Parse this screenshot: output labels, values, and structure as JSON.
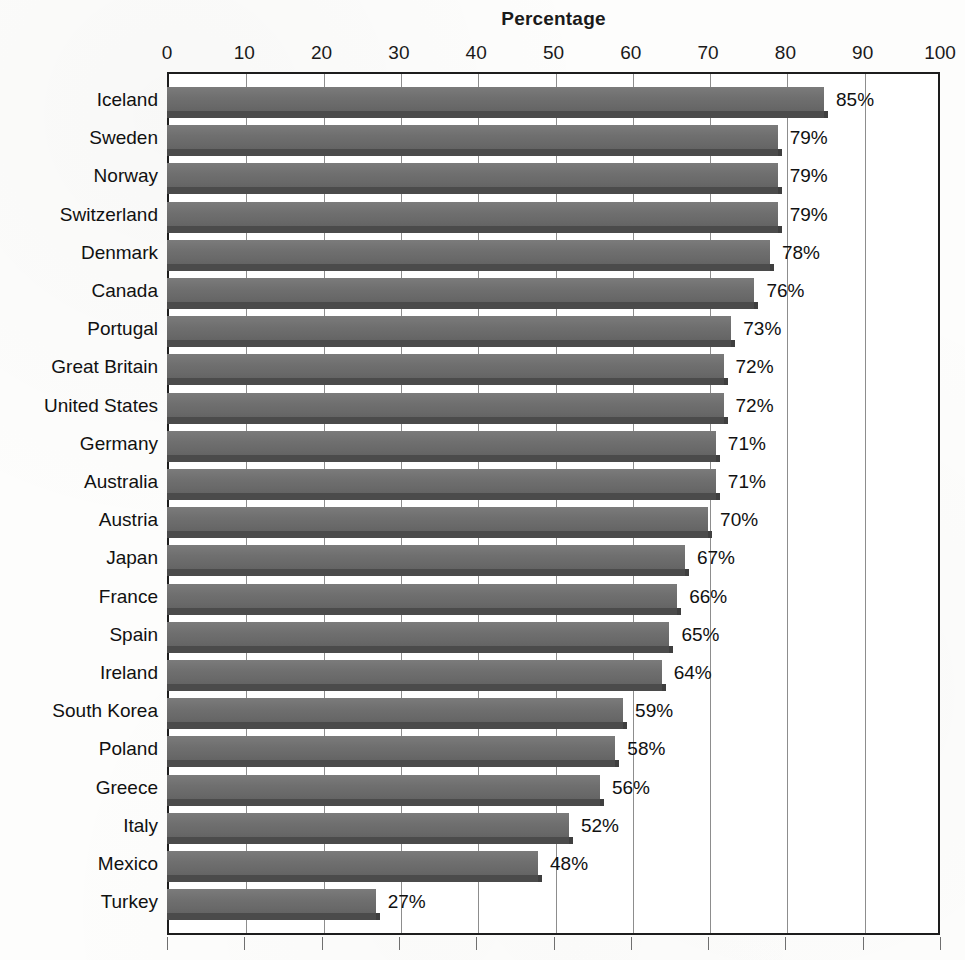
{
  "chart_data": {
    "type": "bar",
    "orientation": "horizontal",
    "title": "Percentage",
    "xlabel": "",
    "ylabel": "",
    "xlim": [
      0,
      100
    ],
    "xticks": [
      0,
      10,
      20,
      30,
      40,
      50,
      60,
      70,
      80,
      90,
      100
    ],
    "xtick_labels": [
      "0",
      "10",
      "20",
      "30",
      "40",
      "50",
      "60",
      "70",
      "80",
      "90",
      "100"
    ],
    "grid": true,
    "legend": false,
    "value_label_suffix": "%",
    "categories": [
      "Iceland",
      "Sweden",
      "Norway",
      "Switzerland",
      "Denmark",
      "Canada",
      "Portugal",
      "Great Britain",
      "United States",
      "Germany",
      "Australia",
      "Austria",
      "Japan",
      "France",
      "Spain",
      "Ireland",
      "South Korea",
      "Poland",
      "Greece",
      "Italy",
      "Mexico",
      "Turkey"
    ],
    "values": [
      85,
      79,
      79,
      79,
      78,
      76,
      73,
      72,
      72,
      71,
      71,
      70,
      67,
      66,
      65,
      64,
      59,
      58,
      56,
      52,
      48,
      27
    ],
    "value_labels": [
      "85%",
      "79%",
      "79%",
      "79%",
      "78%",
      "76%",
      "73%",
      "72%",
      "72%",
      "71%",
      "71%",
      "70%",
      "67%",
      "66%",
      "65%",
      "64%",
      "59%",
      "58%",
      "56%",
      "52%",
      "48%",
      "27%"
    ],
    "colors": {
      "bar_fill": "#6f6f6f",
      "bar_shadow": "#4b4b4b",
      "axis": "#1d1d1d",
      "gridline": "#8d8d8d",
      "text": "#111111",
      "background": "#fdfdfc"
    }
  }
}
